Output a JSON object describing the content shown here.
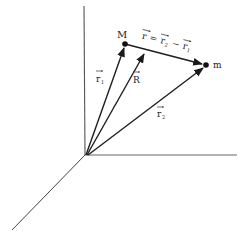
{
  "diagram": {
    "colors": {
      "line": "#2a2a2a",
      "axis": "#555555",
      "background": "#ffffff"
    },
    "origin": {
      "x": 86,
      "y": 155
    },
    "axes": [
      {
        "name": "vertical-axis",
        "x2": 84,
        "y2": 6
      },
      {
        "name": "horizontal-axis",
        "x2": 237,
        "y2": 155
      },
      {
        "name": "depth-axis",
        "x2": 12,
        "y2": 230
      }
    ],
    "points": [
      {
        "id": "M",
        "label": "M",
        "x": 125,
        "y": 44
      },
      {
        "id": "m",
        "label": "m",
        "x": 206,
        "y": 65
      }
    ],
    "vectors": [
      {
        "id": "r1",
        "label": "r",
        "subscript": "1",
        "from": "origin",
        "to": "M"
      },
      {
        "id": "R",
        "label": "R",
        "subscript": "",
        "from": "origin",
        "to_xy": [
          145,
          51
        ]
      },
      {
        "id": "r2",
        "label": "r",
        "subscript": "2",
        "from": "origin",
        "to": "m"
      },
      {
        "id": "r",
        "label": "r",
        "subscript": "",
        "from": "M",
        "to": "m"
      }
    ],
    "equation": {
      "lhs": "r",
      "eq": "=",
      "a": "r",
      "a_sub": "2",
      "minus": "−",
      "b": "r",
      "b_sub": "1"
    }
  }
}
